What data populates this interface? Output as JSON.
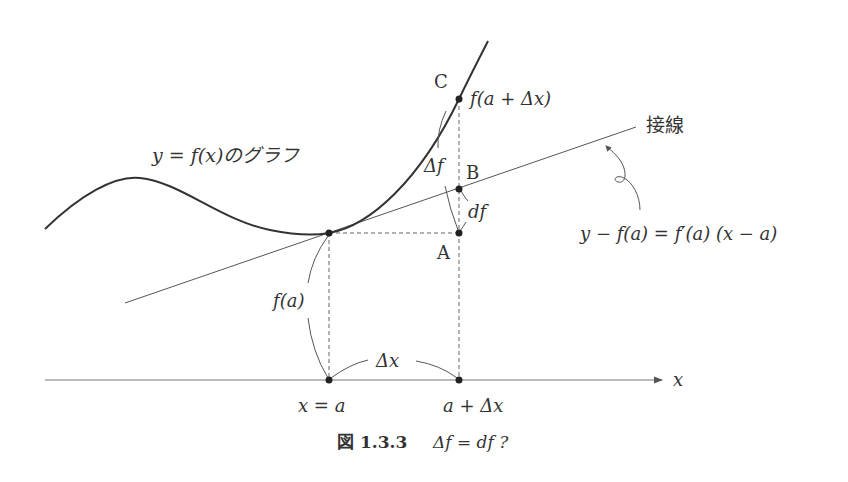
{
  "figure": {
    "graph_label": "y = f(x)のグラフ",
    "tangent_label": "接線",
    "tangent_equation": "y − f(a) = f′(a) (x − a)",
    "points": {
      "A": "A",
      "B": "B",
      "C": "C"
    },
    "labels": {
      "f_a_plus_dx": "f(a + Δx)",
      "delta_f": "Δf",
      "df": "df",
      "f_a": "f(a)",
      "delta_x": "Δx",
      "x_eq_a": "x = a",
      "a_plus_dx": "a + Δx",
      "x_axis": "x"
    },
    "caption": {
      "number": "図 1.3.3",
      "text": "Δf = df ?"
    }
  }
}
